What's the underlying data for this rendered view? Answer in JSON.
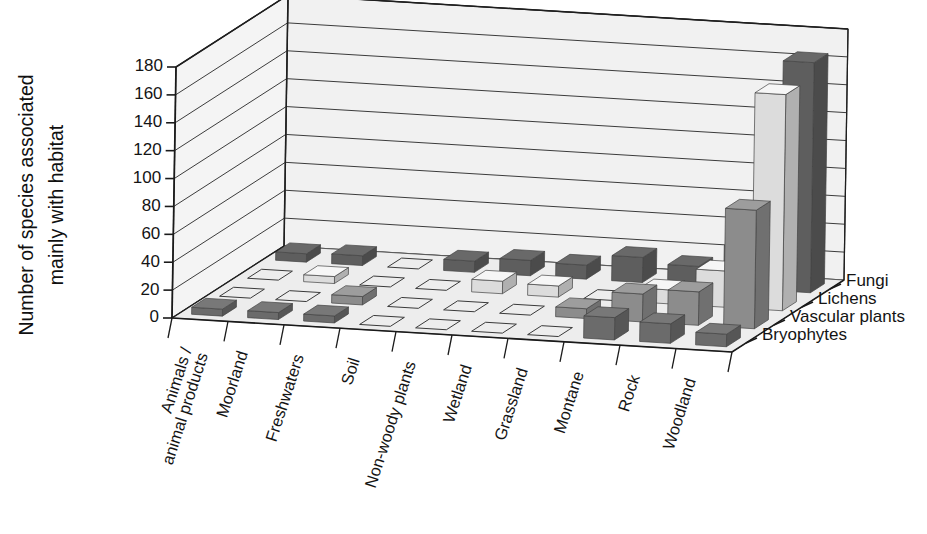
{
  "chart_data": {
    "type": "bar",
    "title": "",
    "ylabel": "Number of species associated mainly with habitat",
    "ylabel_line1": "Number of species associated",
    "ylabel_line2": "mainly with habitat",
    "xlabel": "",
    "zlabel": "",
    "ylim": [
      0,
      180
    ],
    "ytick_step": 20,
    "yticks": [
      0,
      20,
      40,
      60,
      80,
      100,
      120,
      140,
      160,
      180
    ],
    "ytick_labels": [
      "0",
      "20",
      "40",
      "60",
      "80",
      "100",
      "120",
      "140",
      "160",
      "180"
    ],
    "grid": true,
    "legend_position": "right-depth-axis",
    "projection": "3d-bars",
    "categories": [
      "Animals / animal products",
      "Moorland",
      "Freshwaters",
      "Soil",
      "Non-woody plants",
      "Wetland",
      "Grassland",
      "Montane",
      "Rock",
      "Woodland"
    ],
    "category_labels": [
      [
        "Animals /",
        "animal products"
      ],
      [
        "Moorland"
      ],
      [
        "Freshwaters"
      ],
      [
        "Soil"
      ],
      [
        "Non-woody plants"
      ],
      [
        "Wetland"
      ],
      [
        "Grassland"
      ],
      [
        "Montane"
      ],
      [
        "Rock"
      ],
      [
        "Woodland"
      ]
    ],
    "series": [
      {
        "name": "Fungi",
        "color": "#5e5e5e",
        "depth_index": 3,
        "values": [
          6,
          7,
          0,
          8,
          11,
          10,
          18,
          14,
          30,
          165
        ]
      },
      {
        "name": "Lichens",
        "color": "#dcdcdc",
        "depth_index": 2,
        "values": [
          0,
          5,
          0,
          0,
          9,
          8,
          0,
          10,
          26,
          155
        ]
      },
      {
        "name": "Vascular plants",
        "color": "#8c8c8c",
        "depth_index": 1,
        "values": [
          0,
          0,
          6,
          0,
          0,
          0,
          7,
          20,
          24,
          85
        ]
      },
      {
        "name": "Bryophytes",
        "color": "#6b6b6b",
        "depth_index": 0,
        "values": [
          5,
          5,
          5,
          0,
          0,
          0,
          0,
          16,
          14,
          9
        ]
      }
    ]
  },
  "legend": {
    "items": [
      {
        "label": "Fungi"
      },
      {
        "label": "Lichens"
      },
      {
        "label": "Vascular plants"
      },
      {
        "label": "Bryophytes"
      }
    ]
  },
  "colors": {
    "fungi": "#5e5e5e",
    "lichens": "#dcdcdc",
    "vascular_plants": "#8c8c8c",
    "bryophytes": "#6b6b6b",
    "wall": "#f1f1f1",
    "floor": "#ededed",
    "grid": "#3c3c3c",
    "text": "#141414",
    "background": "#ffffff"
  }
}
